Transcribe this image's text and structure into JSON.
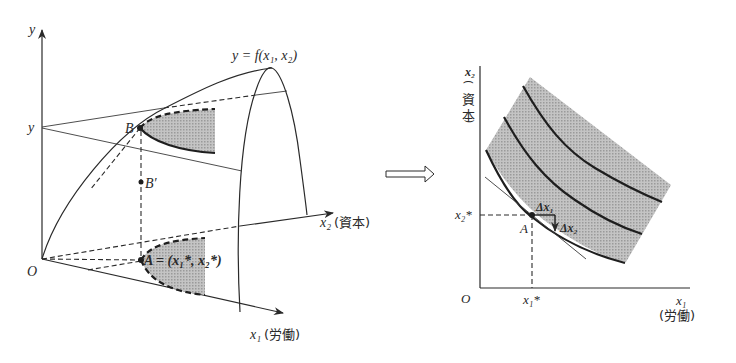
{
  "left_panel": {
    "axis_y_label": "y",
    "level_label": "y",
    "function_label": "y = f(x₁, x₂)",
    "origin_label": "O",
    "axis_x2_label": "x₂",
    "axis_x2_cjk": "(資本)",
    "axis_x1_label": "x₁",
    "axis_x1_cjk": "(労働)",
    "point_B_label": "B",
    "point_Bprime_label": "B′",
    "point_A_label": "A = (x₁*, x₂*)"
  },
  "transition_arrow": "implies-arrow",
  "right_panel": {
    "axis_y_label": "x₂",
    "axis_y_cjk": [
      "(",
      "資",
      "本",
      ")"
    ],
    "axis_x_label": "x₁",
    "axis_x_cjk": "(労働)",
    "origin_label": "O",
    "x2_star_label": "x₂*",
    "x1_star_label": "x₁*",
    "point_A_label": "A",
    "delta_x1_label": "Δx₁",
    "delta_x2_label": "Δx₂"
  },
  "colors": {
    "ink": "#2a2a2a",
    "shade": "#b8b8b8",
    "background": "#ffffff"
  }
}
